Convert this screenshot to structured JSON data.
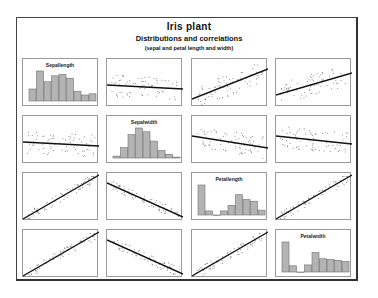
{
  "title": "Iris plant",
  "subtitle": "Distributions and correlations",
  "caption": "(sepal and petal length and width)",
  "colors": {
    "bar_fill": "#b4b4b4",
    "bar_stroke": "#6e6e6e",
    "line": "#111111",
    "points": "#777777",
    "panel_border": "#9a9a9a",
    "frame": "#444444"
  },
  "chart_data": {
    "type": "scatter-matrix",
    "title": "Iris plant",
    "subtitle": "Distributions and correlations (sepal and petal length and width)",
    "variables": [
      "Sepallength",
      "Sepalwidth",
      "Petallength",
      "Petalwidth"
    ],
    "grid": "4x4",
    "diagonal": "histogram",
    "off_diagonal": "scatter with regression line",
    "histograms": {
      "Sepallength": [
        10,
        25,
        16,
        21,
        22,
        19,
        8,
        5,
        6
      ],
      "Sepalwidth": [
        2,
        11,
        25,
        32,
        28,
        18,
        8,
        4,
        1
      ],
      "Petallength": [
        37,
        5,
        0,
        5,
        12,
        25,
        19,
        17,
        6
      ],
      "Petalwidth": [
        34,
        7,
        0,
        8,
        22,
        15,
        14,
        13,
        12
      ]
    },
    "regression_slopes": {
      "Sepallength-Sepalwidth": "slightly negative",
      "Sepallength-Petallength": "positive",
      "Sepallength-Petalwidth": "positive",
      "Sepalwidth-Petallength": "negative",
      "Sepalwidth-Petalwidth": "negative",
      "Petallength-Petalwidth": "strong positive"
    }
  }
}
